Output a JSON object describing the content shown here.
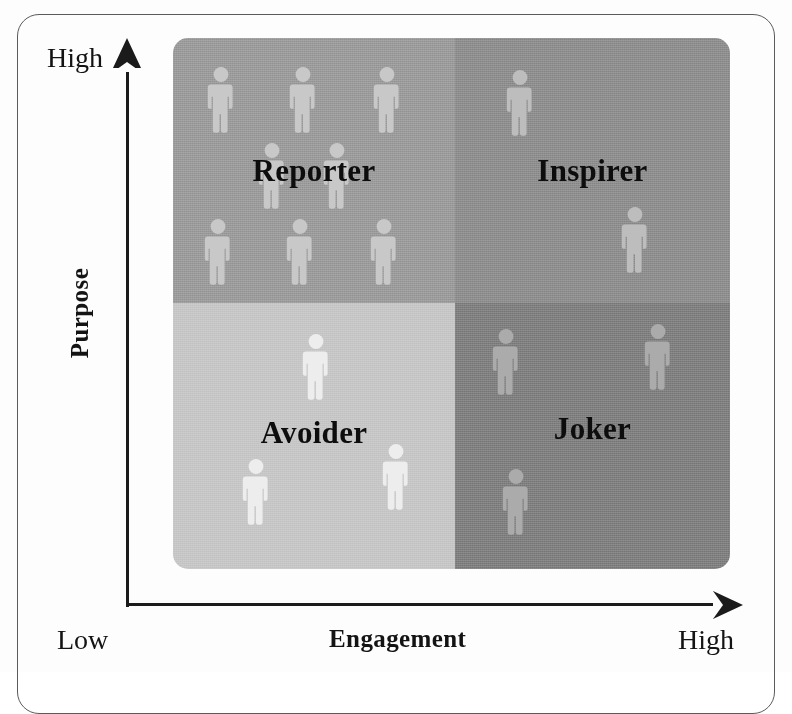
{
  "figure": {
    "type": "2x2-matrix",
    "frame_color": "#5b5b5b",
    "background": "#fdfdfd"
  },
  "axes": {
    "y": {
      "title": "Purpose",
      "high_label": "High",
      "arrow_direction": "up",
      "line_color": "#1b1b1b"
    },
    "x": {
      "title": "Engagement",
      "low_label": "Low",
      "high_label": "High",
      "arrow_direction": "right",
      "line_color": "#1b1b1b"
    }
  },
  "chart_data": {
    "type": "table",
    "title": "",
    "xlabel": "Engagement",
    "ylabel": "Purpose",
    "x_ticks": [
      "Low",
      "High"
    ],
    "y_ticks": [
      "Low",
      "High"
    ],
    "grid": false,
    "legend": "none",
    "categories": [
      "Reporter",
      "Inspirer",
      "Avoider",
      "Joker"
    ],
    "values": [
      8,
      2,
      3,
      3
    ],
    "series": [
      {
        "name": "people-count",
        "values": [
          8,
          2,
          3,
          3
        ]
      }
    ],
    "quadrants": [
      {
        "name": "Reporter",
        "engagement": "Low",
        "purpose": "High",
        "position": "top-left",
        "fill": "#9a9a9a",
        "icon_fill": "#c8c8c8",
        "people_count": 8
      },
      {
        "name": "Inspirer",
        "engagement": "High",
        "purpose": "High",
        "position": "top-right",
        "fill": "#8d8d8d",
        "icon_fill": "#bdbdbd",
        "people_count": 2
      },
      {
        "name": "Avoider",
        "engagement": "Low",
        "purpose": "Low",
        "position": "bottom-left",
        "fill": "#c6c6c6",
        "icon_fill": "#ededed",
        "people_count": 3
      },
      {
        "name": "Joker",
        "engagement": "High",
        "purpose": "Low",
        "position": "bottom-right",
        "fill": "#7e7e7e",
        "icon_fill": "#ababab",
        "people_count": 3
      }
    ]
  },
  "people": {
    "reporter": [
      {
        "x": 33,
        "y": 28,
        "w": 30,
        "h": 78
      },
      {
        "x": 115,
        "y": 28,
        "w": 30,
        "h": 78
      },
      {
        "x": 199,
        "y": 28,
        "w": 30,
        "h": 78
      },
      {
        "x": 84,
        "y": 104,
        "w": 30,
        "h": 78
      },
      {
        "x": 149,
        "y": 104,
        "w": 30,
        "h": 78
      },
      {
        "x": 30,
        "y": 180,
        "w": 30,
        "h": 78
      },
      {
        "x": 112,
        "y": 180,
        "w": 30,
        "h": 78
      },
      {
        "x": 196,
        "y": 180,
        "w": 30,
        "h": 78
      }
    ],
    "inspirer": [
      {
        "x": 50,
        "y": 31,
        "w": 30,
        "h": 78
      },
      {
        "x": 165,
        "y": 168,
        "w": 30,
        "h": 78
      }
    ],
    "avoider": [
      {
        "x": 128,
        "y": 30,
        "w": 30,
        "h": 78
      },
      {
        "x": 68,
        "y": 155,
        "w": 30,
        "h": 78
      },
      {
        "x": 208,
        "y": 140,
        "w": 30,
        "h": 78
      }
    ],
    "joker": [
      {
        "x": 36,
        "y": 25,
        "w": 30,
        "h": 78
      },
      {
        "x": 188,
        "y": 20,
        "w": 30,
        "h": 78
      },
      {
        "x": 46,
        "y": 165,
        "w": 30,
        "h": 78
      }
    ]
  },
  "labels": {
    "reporter": "Reporter",
    "inspirer": "Inspirer",
    "avoider": "Avoider",
    "joker": "Joker"
  }
}
